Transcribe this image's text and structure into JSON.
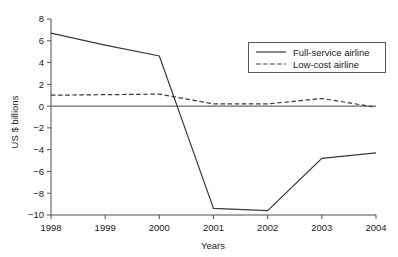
{
  "figure": {
    "ylabel": "US $ billions",
    "xlabel": "Years",
    "background_color": "#ffffff",
    "line_color": "#3a3a3a",
    "axis_color": "#4d4d4d"
  },
  "legend": {
    "position": "top-right",
    "entries": [
      {
        "label": "Full-service airline",
        "style": "solid"
      },
      {
        "label": "Low-cost airline",
        "style": "dashed"
      }
    ]
  },
  "axes": {
    "y_ticks": [
      "8",
      "6",
      "4",
      "2",
      "0",
      "−2",
      "−4",
      "−6",
      "−8",
      "−10"
    ],
    "x_ticks": [
      "1998",
      "1999",
      "2000",
      "2001",
      "2002",
      "2003",
      "2004"
    ]
  },
  "chart_data": {
    "type": "line",
    "title": "",
    "xlabel": "Years",
    "ylabel": "US $ billions",
    "x": [
      1998,
      1999,
      2000,
      2001,
      2002,
      2003,
      2004
    ],
    "categories": [
      "1998",
      "1999",
      "2000",
      "2001",
      "2002",
      "2003",
      "2004"
    ],
    "xlim": [
      1998,
      2004
    ],
    "ylim": [
      -10,
      8
    ],
    "y_tick_values": [
      8,
      6,
      4,
      2,
      0,
      -2,
      -4,
      -6,
      -8,
      -10
    ],
    "grid": false,
    "legend_position": "upper right",
    "zero_reference_line": true,
    "series": [
      {
        "name": "Full-service airline",
        "style": "solid",
        "values": [
          6.7,
          5.6,
          4.6,
          -9.4,
          -9.6,
          -4.8,
          -4.3
        ]
      },
      {
        "name": "Low-cost airline",
        "style": "dashed",
        "values": [
          1.0,
          1.05,
          1.1,
          0.2,
          0.2,
          0.7,
          -0.1
        ]
      }
    ]
  }
}
